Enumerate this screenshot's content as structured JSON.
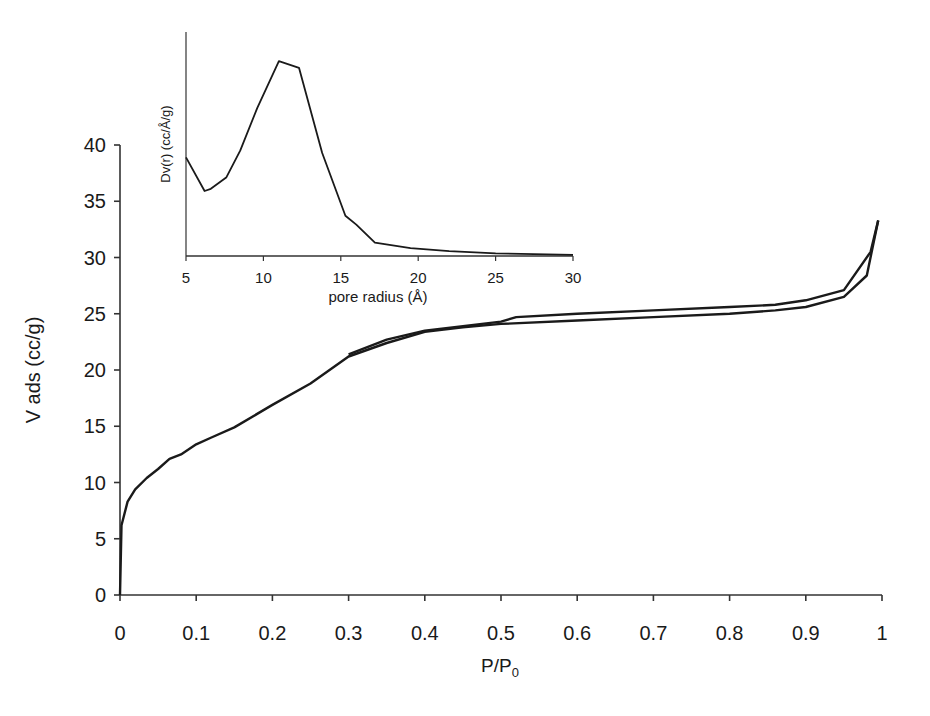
{
  "chart_data": [
    {
      "id": "main",
      "type": "line",
      "title": "",
      "xlabel": "P/P0",
      "xlabel_main": "P/P",
      "xlabel_sub": "0",
      "ylabel": "V ads (cc/g)",
      "xlim": [
        0,
        1
      ],
      "ylim": [
        0,
        40
      ],
      "xticks": [
        "0",
        "0.1",
        "0.2",
        "0.3",
        "0.4",
        "0.5",
        "0.6",
        "0.7",
        "0.8",
        "0.9",
        "1"
      ],
      "yticks": [
        "0",
        "5",
        "10",
        "15",
        "20",
        "25",
        "30",
        "35",
        "40"
      ],
      "grid": false,
      "legend": null,
      "series": [
        {
          "name": "Adsorption",
          "x": [
            0,
            0.002,
            0.01,
            0.02,
            0.035,
            0.05,
            0.065,
            0.08,
            0.1,
            0.12,
            0.15,
            0.2,
            0.25,
            0.3,
            0.35,
            0.4,
            0.45,
            0.5,
            0.6,
            0.7,
            0.8,
            0.86,
            0.9,
            0.95,
            0.98,
            0.995
          ],
          "y": [
            0,
            6.2,
            8.3,
            9.4,
            10.4,
            11.2,
            12.1,
            12.5,
            13.4,
            14.0,
            14.9,
            16.9,
            18.8,
            21.2,
            22.4,
            23.4,
            23.8,
            24.1,
            24.4,
            24.7,
            25.0,
            25.3,
            25.6,
            26.5,
            28.4,
            33.3
          ]
        },
        {
          "name": "Desorption",
          "x": [
            0.995,
            0.985,
            0.95,
            0.9,
            0.86,
            0.8,
            0.7,
            0.6,
            0.52,
            0.5,
            0.45,
            0.4,
            0.35,
            0.3
          ],
          "y": [
            33.3,
            30.5,
            27.1,
            26.2,
            25.8,
            25.6,
            25.3,
            25.0,
            24.7,
            24.3,
            23.9,
            23.5,
            22.7,
            21.4
          ]
        }
      ]
    },
    {
      "id": "inset",
      "type": "line",
      "title": "",
      "xlabel": "pore radius (Å)",
      "ylabel": "Dv(r) (cc/Å/g)",
      "xlim": [
        5,
        30
      ],
      "ylim": [
        0,
        1
      ],
      "xticks": [
        "5",
        "10",
        "15",
        "20",
        "25",
        "30"
      ],
      "yticks": [],
      "grid": false,
      "legend": null,
      "series": [
        {
          "name": "Pore size distribution",
          "x": [
            5,
            6.2,
            6.6,
            7.6,
            8.5,
            9.6,
            11.0,
            12.3,
            13.8,
            15.3,
            16.0,
            17.2,
            19.5,
            22,
            25,
            30
          ],
          "y": [
            0.44,
            0.29,
            0.3,
            0.35,
            0.47,
            0.66,
            0.87,
            0.84,
            0.46,
            0.18,
            0.14,
            0.06,
            0.035,
            0.022,
            0.012,
            0.005
          ]
        }
      ]
    }
  ]
}
